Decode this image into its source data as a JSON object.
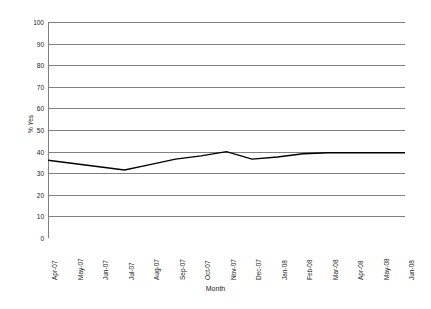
{
  "chart_data": {
    "type": "line",
    "title": "",
    "xlabel": "Month",
    "ylabel": "% Yes",
    "ylim": [
      0,
      100
    ],
    "ytick_step": 10,
    "yticks": [
      100,
      90,
      80,
      70,
      60,
      50,
      40,
      30,
      20,
      10,
      0
    ],
    "grid": true,
    "legend": "none",
    "line_color": "#000000",
    "gridline_color": "#808080",
    "axis_color": "#808080",
    "categories": [
      "Apr-07",
      "May-07",
      "Jun-07",
      "Jul-07",
      "Aug-07",
      "Sep-07",
      "Oct-07",
      "Nov-07",
      "Dec-07",
      "Jan-08",
      "Feb-08",
      "Mar-08",
      "Apr-08",
      "May-08",
      "Jun-08"
    ],
    "values": [
      36,
      34.5,
      33,
      31.5,
      34,
      36.5,
      38,
      40,
      36.5,
      37.5,
      39,
      39.5,
      39.5,
      39.5,
      39.5
    ],
    "series": [
      {
        "name": "% Yes",
        "values": [
          36,
          34.5,
          33,
          31.5,
          34,
          36.5,
          38,
          40,
          36.5,
          37.5,
          39,
          39.5,
          39.5,
          39.5,
          39.5
        ]
      }
    ]
  }
}
